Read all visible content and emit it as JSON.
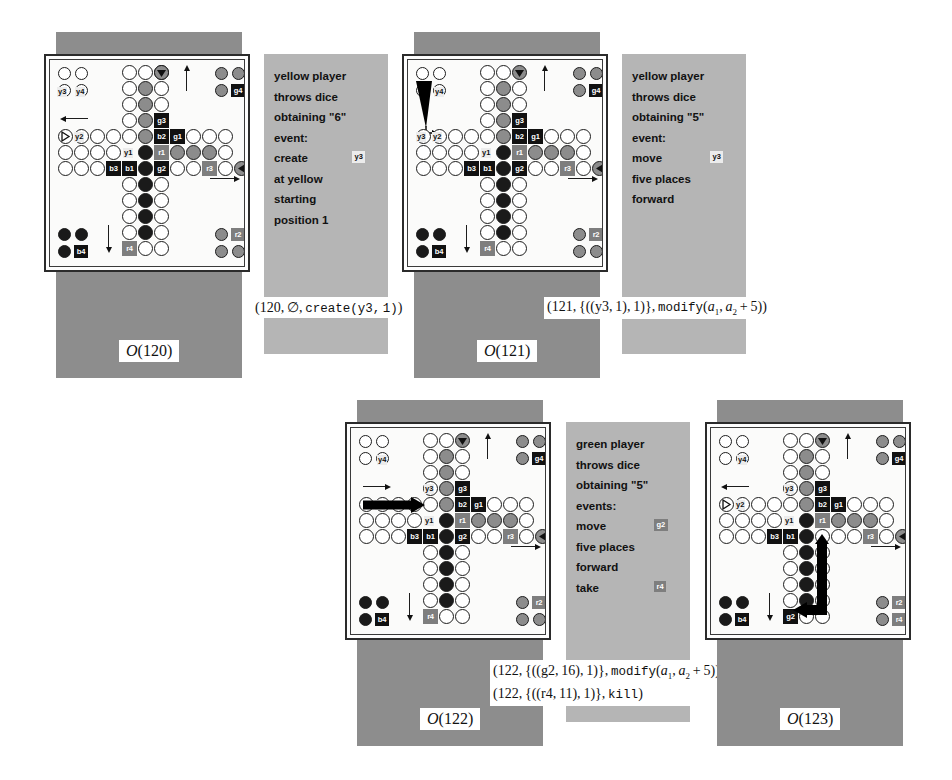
{
  "figure": {
    "type": "ludo-game-state-sequence",
    "panel_count": 4
  },
  "colors": {
    "plate": "#8d8d8d",
    "desc_panel": "#b5b5b5",
    "board_bg": "#fbfbfa",
    "token_black": "#111111",
    "token_grey": "#7e7e7e",
    "label_bg": "#ececec",
    "ink": "#111111"
  },
  "panels": [
    {
      "id": "panel-120",
      "caption": "O(120)",
      "caption_prefix": "O",
      "caption_arg": "(120)",
      "description": {
        "lines": [
          "yellow player",
          "throws dice",
          "obtaining \"6\"",
          "event:",
          "create",
          "at yellow",
          "starting",
          "position 1"
        ],
        "tag": {
          "line_index": 4,
          "label": "y3",
          "style": "light"
        }
      },
      "formula": {
        "text": "(120, ∅, create(y3, 1))",
        "parts": [
          "(120,",
          "∅,",
          "create(y3,1))"
        ]
      },
      "board": {
        "tokens": [
          {
            "id": "y3",
            "style": "plain",
            "pos": "yellow-home-1"
          },
          {
            "id": "y4",
            "style": "plain",
            "pos": "yellow-home-2"
          },
          {
            "id": "y2",
            "style": "plain",
            "pos": "left-track"
          },
          {
            "id": "y1",
            "style": "plain",
            "pos": "left-track-2"
          },
          {
            "id": "b1",
            "style": "black",
            "pos": "left-track-3"
          },
          {
            "id": "b2",
            "style": "black",
            "pos": "center-right"
          },
          {
            "id": "b3",
            "style": "black",
            "pos": "left-track-3"
          },
          {
            "id": "b4",
            "style": "black",
            "pos": "blue-home"
          },
          {
            "id": "g1",
            "style": "black",
            "pos": "right-track"
          },
          {
            "id": "g2",
            "style": "grey",
            "pos": "lower-center"
          },
          {
            "id": "g3",
            "style": "grey",
            "pos": "upper-center"
          },
          {
            "id": "g4",
            "style": "black",
            "pos": "green-home"
          },
          {
            "id": "r1",
            "style": "grey",
            "pos": "center-row"
          },
          {
            "id": "r2",
            "style": "grey",
            "pos": "red-home"
          },
          {
            "id": "r3",
            "style": "grey",
            "pos": "right-row"
          },
          {
            "id": "r4",
            "style": "grey",
            "pos": "bottom-center"
          }
        ]
      },
      "move_arrow": null
    },
    {
      "id": "panel-121",
      "caption": "O(121)",
      "caption_prefix": "O",
      "caption_arg": "(121)",
      "description": {
        "lines": [
          "yellow player",
          "throws dice",
          "obtaining \"5\"",
          "event:",
          "move",
          "five places",
          "forward"
        ],
        "tag": {
          "line_index": 4,
          "label": "y3",
          "style": "light"
        }
      },
      "formula": {
        "text": "(121, {((y3,1),1)}, modify(a1, a2 + 5))"
      },
      "board": {
        "note": "y3 moved out of yellow home to start position"
      },
      "move_arrow": {
        "kind": "triangle-down",
        "from": "yellow-home",
        "to": "yellow-start"
      }
    },
    {
      "id": "panel-122",
      "caption": "O(122)",
      "caption_prefix": "O",
      "caption_arg": "(122)",
      "description": {
        "lines": [
          "green player",
          "throws dice",
          "obtaining \"5\"",
          "events:",
          "move",
          "five places",
          "forward",
          "take"
        ],
        "tags": [
          {
            "line_index": 4,
            "label": "g2",
            "style": "grey"
          },
          {
            "line_index": 7,
            "label": "r4",
            "style": "grey"
          }
        ]
      },
      "formula": {
        "line1": "(122, {((g2,16),1)}, modify(a1, a2 + 5))",
        "line2": "(122, {((r4,11),1)}, kill)"
      },
      "board": {
        "note": "y3 advanced five places along left row"
      },
      "move_arrow": {
        "kind": "horizontal-thick",
        "from": "left-row-start",
        "to": "y3-position"
      }
    },
    {
      "id": "panel-123",
      "caption": "O(123)",
      "caption_prefix": "O",
      "caption_arg": "(123)",
      "description": null,
      "formula": null,
      "board": {
        "note": "g2 moved down and left to bottom row, r4 killed to red home"
      },
      "move_arrow": {
        "kind": "L-shaped-thick",
        "from": "g2-old",
        "to": "g2-new"
      }
    }
  ],
  "shared_formula_block": {
    "line1": "(122, {((g2,16),1)}, modify(a1, a2 + 5))",
    "line2": "(122, {((r4,11),1)}, kill)"
  }
}
